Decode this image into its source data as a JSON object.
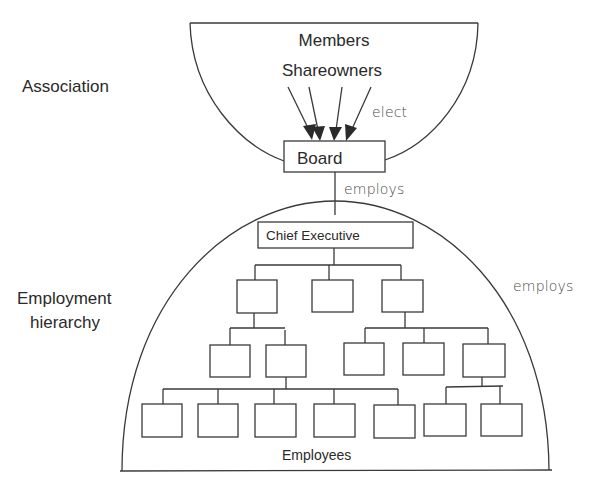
{
  "diagram": {
    "side_labels": {
      "association": "Association",
      "employment_line1": "Employment",
      "employment_line2": "hierarchy"
    },
    "association": {
      "members": "Members",
      "shareowners": "Shareowners",
      "elect_label": "elect",
      "arrow_count": 4
    },
    "board": {
      "label": "Board"
    },
    "edges": {
      "board_to_ce": "employs",
      "ce_to_hierarchy": "employs"
    },
    "hierarchy": {
      "chief_executive": "Chief Executive",
      "level1_boxes": 3,
      "level2_boxes": 5,
      "level3_boxes": 7,
      "employees_label": "Employees"
    },
    "colors": {
      "line": "#3a3a3a",
      "text": "#2a2a2a",
      "background": "#ffffff"
    }
  }
}
